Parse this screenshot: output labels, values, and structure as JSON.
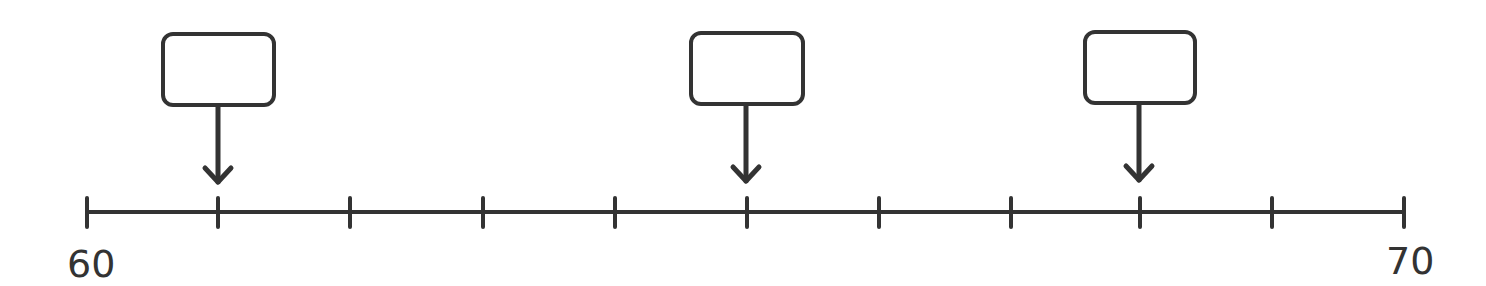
{
  "number_line": {
    "min": 60,
    "max": 70,
    "step": 1,
    "start_label": "60",
    "end_label": "70",
    "tick_count": 11,
    "line_color": "#333333"
  },
  "markers": [
    {
      "value": 61,
      "box_text": ""
    },
    {
      "value": 65,
      "box_text": ""
    },
    {
      "value": 68,
      "box_text": ""
    }
  ]
}
